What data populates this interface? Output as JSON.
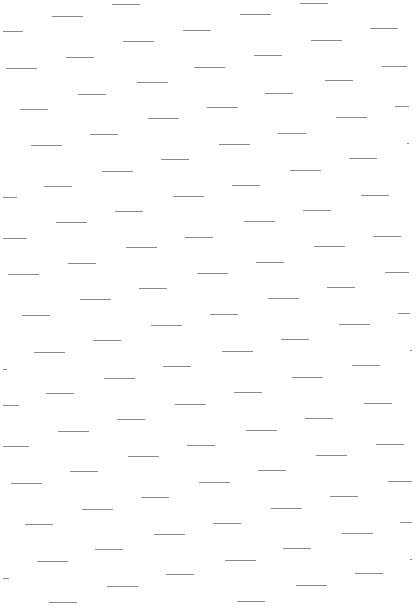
{
  "pattern": {
    "background": "#ffffff",
    "dash_color": "#8a8a8a",
    "dashes": [
      [
        112,
        4,
        28
      ],
      [
        300,
        3,
        28
      ],
      [
        52,
        16,
        31
      ],
      [
        240,
        14,
        31
      ],
      [
        3,
        31,
        20
      ],
      [
        183,
        30,
        28
      ],
      [
        370,
        28,
        28
      ],
      [
        123,
        41,
        31
      ],
      [
        311,
        40,
        31
      ],
      [
        6,
        68,
        31
      ],
      [
        66,
        57,
        28
      ],
      [
        194,
        67,
        31
      ],
      [
        254,
        55,
        28
      ],
      [
        382,
        66,
        25
      ],
      [
        78,
        94,
        28
      ],
      [
        265,
        93,
        28
      ],
      [
        137,
        82,
        31
      ],
      [
        325,
        80,
        28
      ],
      [
        20,
        109,
        28
      ],
      [
        207,
        107,
        31
      ],
      [
        395,
        106,
        14
      ],
      [
        148,
        118,
        31
      ],
      [
        336,
        117,
        31
      ],
      [
        90,
        134,
        28
      ],
      [
        278,
        133,
        28
      ],
      [
        31,
        145,
        31
      ],
      [
        219,
        144,
        31
      ],
      [
        407,
        143,
        2
      ],
      [
        161,
        159,
        28
      ],
      [
        349,
        158,
        28
      ],
      [
        102,
        171,
        31
      ],
      [
        290,
        170,
        31
      ],
      [
        44,
        186,
        28
      ],
      [
        232,
        185,
        28
      ],
      [
        3,
        197,
        14
      ],
      [
        173,
        196,
        31
      ],
      [
        361,
        195,
        28
      ],
      [
        115,
        211,
        28
      ],
      [
        303,
        210,
        28
      ],
      [
        56,
        222,
        31
      ],
      [
        244,
        221,
        31
      ],
      [
        3,
        238,
        24
      ],
      [
        185,
        237,
        28
      ],
      [
        373,
        236,
        28
      ],
      [
        126,
        247,
        31
      ],
      [
        314,
        246,
        31
      ],
      [
        68,
        263,
        28
      ],
      [
        256,
        262,
        28
      ],
      [
        8,
        274,
        31
      ],
      [
        197,
        273,
        31
      ],
      [
        385,
        272,
        24
      ],
      [
        139,
        288,
        28
      ],
      [
        327,
        287,
        28
      ],
      [
        80,
        299,
        31
      ],
      [
        268,
        298,
        31
      ],
      [
        22,
        315,
        28
      ],
      [
        210,
        314,
        28
      ],
      [
        398,
        313,
        12
      ],
      [
        151,
        325,
        31
      ],
      [
        339,
        324,
        31
      ],
      [
        93,
        340,
        28
      ],
      [
        281,
        339,
        28
      ],
      [
        34,
        352,
        31
      ],
      [
        222,
        351,
        31
      ],
      [
        410,
        350,
        2
      ],
      [
        3,
        369,
        4
      ],
      [
        163,
        366,
        28
      ],
      [
        352,
        365,
        28
      ],
      [
        104,
        378,
        31
      ],
      [
        292,
        377,
        31
      ],
      [
        46,
        393,
        28
      ],
      [
        234,
        392,
        28
      ],
      [
        3,
        405,
        16
      ],
      [
        175,
        404,
        31
      ],
      [
        364,
        403,
        28
      ],
      [
        117,
        419,
        28
      ],
      [
        305,
        418,
        28
      ],
      [
        58,
        431,
        31
      ],
      [
        246,
        430,
        31
      ],
      [
        3,
        446,
        26
      ],
      [
        187,
        445,
        28
      ],
      [
        376,
        444,
        28
      ],
      [
        128,
        456,
        31
      ],
      [
        316,
        455,
        31
      ],
      [
        70,
        471,
        28
      ],
      [
        258,
        470,
        28
      ],
      [
        11,
        483,
        31
      ],
      [
        199,
        482,
        31
      ],
      [
        388,
        481,
        24
      ],
      [
        141,
        497,
        28
      ],
      [
        330,
        496,
        28
      ],
      [
        82,
        509,
        31
      ],
      [
        271,
        508,
        31
      ],
      [
        25,
        524,
        28
      ],
      [
        213,
        523,
        28
      ],
      [
        400,
        522,
        12
      ],
      [
        154,
        534,
        31
      ],
      [
        342,
        533,
        31
      ],
      [
        95,
        549,
        28
      ],
      [
        283,
        548,
        28
      ],
      [
        37,
        561,
        31
      ],
      [
        225,
        560,
        31
      ],
      [
        410,
        559,
        2
      ],
      [
        3,
        578,
        6
      ],
      [
        166,
        574,
        28
      ],
      [
        355,
        573,
        28
      ],
      [
        107,
        586,
        31
      ],
      [
        296,
        585,
        31
      ],
      [
        49,
        602,
        28
      ],
      [
        237,
        601,
        28
      ]
    ]
  }
}
